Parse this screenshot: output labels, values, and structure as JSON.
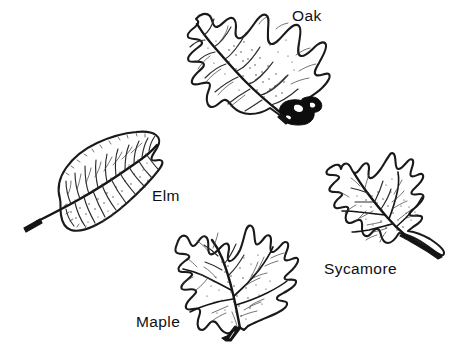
{
  "figure": {
    "background_color": "#ffffff",
    "ink_color": "#0f0f0f",
    "style": "black-and-white botanical line drawing",
    "width": 466,
    "height": 364
  },
  "labels": {
    "oak": "Oak",
    "elm": "Elm",
    "maple": "Maple",
    "sycamore": "Sycamore"
  },
  "specimens": [
    {
      "name": "Oak",
      "label": "Oak",
      "label_x": 292,
      "label_y": 21,
      "position": "top-center",
      "bounds": [
        185,
        5,
        145,
        122
      ],
      "orientation": "tip upper-left, stem lower-right",
      "features": "deeply lobed margin with pointed bristle-tipped lobes, prominent midrib, acorn attached at petiole base, stippled shading"
    },
    {
      "name": "Elm",
      "label": "Elm",
      "label_x": 152,
      "label_y": 201,
      "position": "middle-left",
      "bounds": [
        24,
        128,
        136,
        108
      ],
      "orientation": "tip upper-right, stem lower-left",
      "features": "elongated oval blade, asymmetric base, doubly serrate margin, straight parallel pinnate veins"
    },
    {
      "name": "Maple",
      "label": "Maple",
      "label_x": 136,
      "label_y": 327,
      "position": "bottom-center",
      "bounds": [
        140,
        224,
        152,
        124
      ],
      "orientation": "lobes up, stem lower-left",
      "features": "palmate five-lobed blade with pointed teeth, radiating palmate veins, stippled shading"
    },
    {
      "name": "Sycamore",
      "label": "Sycamore",
      "label_x": 324,
      "label_y": 274,
      "position": "middle-right",
      "bounds": [
        325,
        147,
        118,
        112
      ],
      "orientation": "lobes up-left, stem lower-right",
      "features": "broad palmate three to five lobed blade, coarse teeth, stout petiole, stippled shading"
    }
  ]
}
